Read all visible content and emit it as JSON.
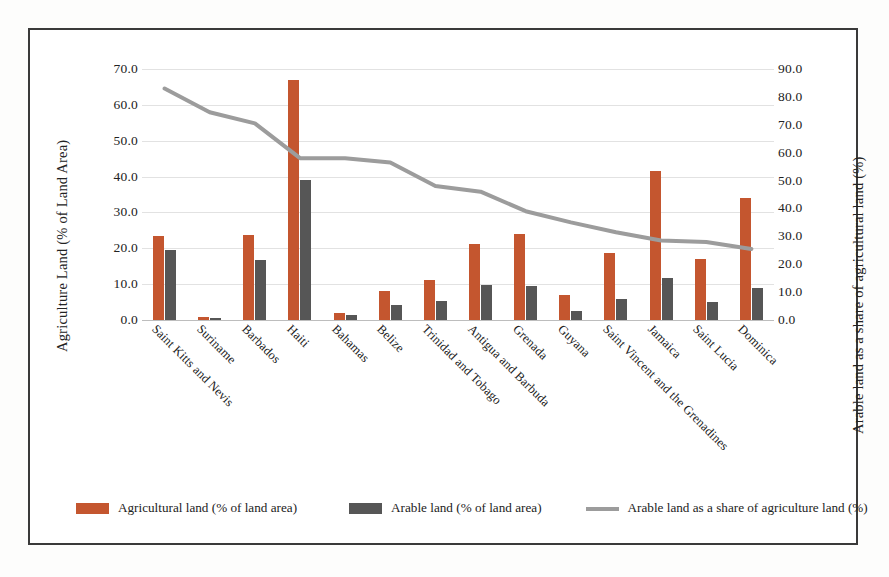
{
  "chart_data": {
    "type": "bar",
    "title": "",
    "subtitle": "",
    "xlabel": "",
    "ylabel": "Agriculture Land (% of  Land Area)",
    "y2label": "Arable land as a share of agricultural land (%)",
    "grid": true,
    "legend_position": "bottom",
    "ylim": [
      0,
      70
    ],
    "y2lim": [
      0,
      90
    ],
    "yticks": [
      "0.0",
      "10.0",
      "20.0",
      "30.0",
      "40.0",
      "50.0",
      "60.0",
      "70.0"
    ],
    "y2ticks": [
      "0.0",
      "10.0",
      "20.0",
      "30.0",
      "40.0",
      "50.0",
      "60.0",
      "70.0",
      "80.0",
      "90.0"
    ],
    "categories": [
      "Saint Kitts and Nevis",
      "Suriname",
      "Barbados",
      "Haiti",
      "Bahamas",
      "Belize",
      "Trinidad and Tobago",
      "Antigua and Barbuda",
      "Grenada",
      "Guyana",
      "Saint Vincent and the Grenadines",
      "Jamaica",
      "Saint Lucia",
      "Dominica"
    ],
    "series": [
      {
        "name": "Agricultural land (% of land area)",
        "kind": "bar",
        "axis": "left",
        "color": "#C4562F",
        "values": [
          23.4,
          0.8,
          23.7,
          67.0,
          1.9,
          8.0,
          11.1,
          21.1,
          24.1,
          6.9,
          18.7,
          41.6,
          17.0,
          34.0
        ]
      },
      {
        "name": "Arable land (% of land area)",
        "kind": "bar",
        "axis": "left",
        "color": "#565656",
        "values": [
          19.4,
          0.6,
          16.8,
          39.0,
          1.3,
          4.3,
          5.3,
          9.8,
          9.4,
          2.4,
          5.9,
          11.8,
          5.1,
          8.8
        ]
      },
      {
        "name": "Arable land as a share of agriculture land (%)",
        "kind": "line",
        "axis": "right",
        "color": "#9c9c9c",
        "values": [
          83.0,
          74.5,
          70.5,
          58.0,
          58.0,
          56.5,
          48.0,
          46.0,
          39.0,
          35.0,
          31.5,
          28.5,
          28.0,
          25.5
        ]
      }
    ]
  },
  "legend": {
    "items": [
      {
        "label": "Agricultural land (% of land area)",
        "marker": "bar-swatch-orange"
      },
      {
        "label": "Arable land (% of land area)",
        "marker": "bar-swatch-grey"
      },
      {
        "label": "Arable land as a share of agriculture land (%)",
        "marker": "line-swatch-grey"
      }
    ]
  },
  "colors": {
    "agricultural_bar": "#C4562F",
    "arable_bar": "#565656",
    "share_line": "#9c9c9c",
    "grid": "#e2e2e2",
    "frame": "#3a3a3a"
  }
}
